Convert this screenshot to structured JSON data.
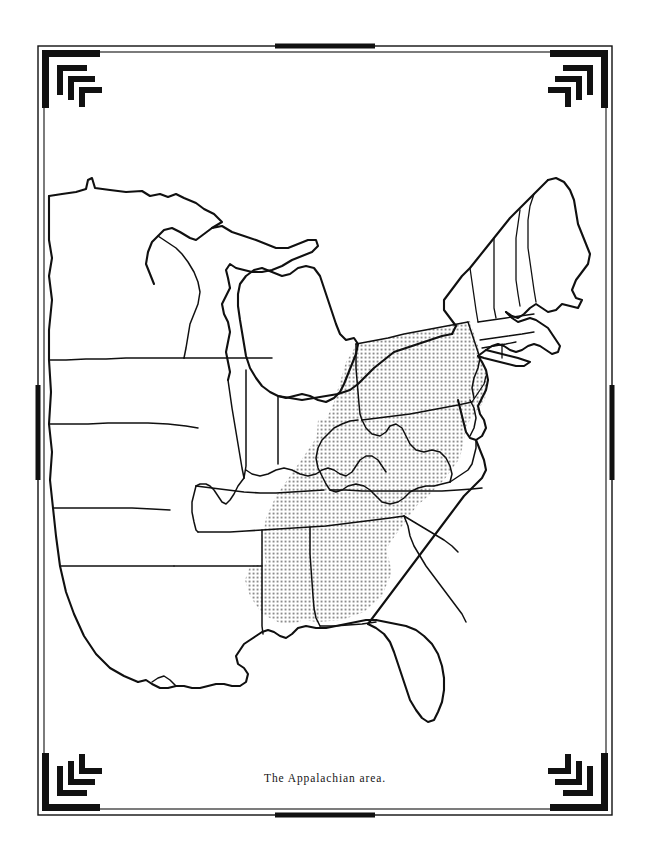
{
  "page": {
    "width": 650,
    "height": 861,
    "background_color": "#ffffff",
    "ink_color": "#101010"
  },
  "figure": {
    "caption": "The Appalachian area.",
    "map_style": "line-art outline map, state boundaries, no labels",
    "shading": {
      "pattern": "dot-screen stipple halftone",
      "tone_hex": "#8c8c8c",
      "description": "A diagonal shaded band running from Pennsylvania southwest through West Virginia, western Virginia, eastern Kentucky, eastern Tennessee, into northern Alabama and northwest Georgia",
      "fully_shaded_states": [
        "Pennsylvania",
        "West Virginia"
      ],
      "partially_shaded_states": [
        "Maryland",
        "Virginia",
        "Kentucky",
        "Tennessee",
        "North Carolina",
        "Georgia",
        "Alabama",
        "Ohio",
        "New York"
      ]
    }
  },
  "frame": {
    "style": "art-deco double rule with nested bracket corner ornaments",
    "color_hex": "#111111",
    "corner_ornaments": [
      {
        "name": "top-left",
        "orientation": "normal"
      },
      {
        "name": "top-right",
        "orientation": "mirrored-horizontal"
      },
      {
        "name": "bottom-left",
        "orientation": "mirrored-vertical"
      },
      {
        "name": "bottom-right",
        "orientation": "mirrored-both"
      }
    ],
    "edge_accents": [
      "top",
      "right",
      "bottom",
      "left"
    ]
  },
  "map_regions": {
    "outline_states": [
      "Minnesota",
      "Iowa",
      "Missouri",
      "Arkansas",
      "Louisiana",
      "Wisconsin",
      "Illinois",
      "Mississippi",
      "Michigan",
      "Indiana",
      "Ohio",
      "Kentucky",
      "Tennessee",
      "Alabama",
      "Georgia",
      "Florida",
      "South Carolina",
      "North Carolina",
      "Virginia",
      "West Virginia",
      "Maryland",
      "Delaware",
      "New Jersey",
      "Pennsylvania",
      "New York",
      "Vermont",
      "New Hampshire",
      "Maine",
      "Massachusetts",
      "Connecticut",
      "Rhode Island"
    ]
  }
}
